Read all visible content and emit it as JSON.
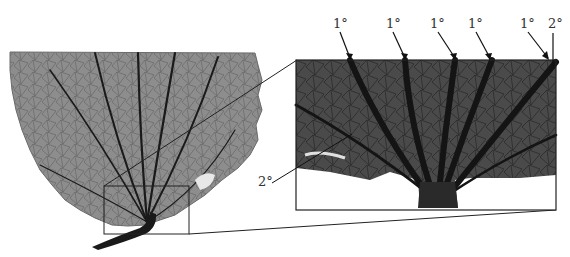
{
  "figure": {
    "labels": {
      "primary": [
        "1°",
        "1°",
        "1°",
        "1°",
        "1°"
      ],
      "secondary_top": "2°",
      "secondary_left": "2°"
    },
    "colors": {
      "leaf": "#8a8a8a",
      "leaf_dark": "#3a3a3a",
      "vein": "#1a1a1a",
      "frame": "#222222",
      "background": "#ffffff"
    }
  }
}
